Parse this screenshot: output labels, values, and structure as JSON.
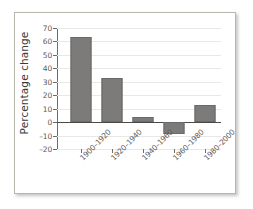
{
  "chart_data": {
    "type": "bar",
    "title": "",
    "xlabel": "",
    "ylabel": "Percentage change",
    "categories": [
      "1900–1920",
      "1920–1940",
      "1940–1960",
      "1960–1980",
      "1980–2000"
    ],
    "values": [
      63,
      33,
      4,
      -9,
      13
    ],
    "ylim": [
      -20,
      70
    ],
    "yticks": [
      70,
      60,
      50,
      40,
      30,
      20,
      10,
      0,
      -10,
      -20
    ],
    "ytick_labels": [
      "70",
      "60",
      "50",
      "40",
      "30",
      "20",
      "10",
      "0",
      "–10",
      "–20"
    ],
    "grid": true,
    "legend": null,
    "bar_color": "#7d7b79",
    "axis_color": "#6f6d6a",
    "gridline_color": "#e8e8e6",
    "zero_line_color": "#4a4a48"
  }
}
